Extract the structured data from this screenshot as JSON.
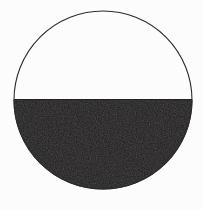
{
  "figure": {
    "caption": "",
    "background_color": "#fdfdfd",
    "outline_color": "#2b2b2b",
    "fill_color": "#1c1a1a",
    "outline_width_px": 1
  },
  "chart_data": {
    "type": "pie",
    "xlabel": "",
    "ylabel": "",
    "categories": [
      "Shaded (lower half)",
      "Unshaded (upper half)"
    ],
    "values": [
      50,
      50
    ],
    "labels": [
      "50%",
      "50%"
    ],
    "colors": [
      "#1c1a1a",
      "#ffffff"
    ],
    "legend": "none",
    "grid": false,
    "annotations": [
      "Horizontal diameter divides the circle",
      "Lower semicircle filled solid black",
      "Upper semicircle left white with thin outline"
    ],
    "geometry": {
      "center_x": 103,
      "center_y": 100,
      "radius": 89,
      "chord_y": 100,
      "chord_x_start": 14,
      "chord_x_end": 192,
      "top_y": 11,
      "bottom_y": 189,
      "shaded_half": "bottom"
    }
  }
}
